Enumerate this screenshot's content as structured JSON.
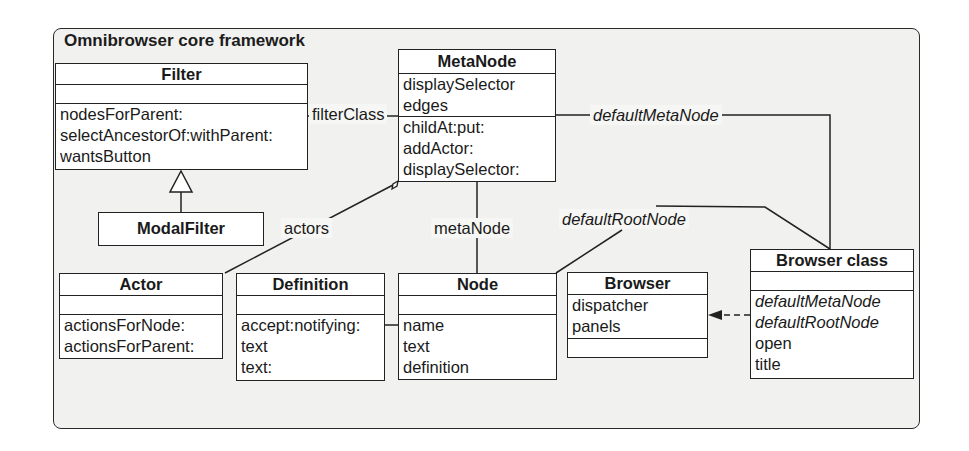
{
  "frame": {
    "title": "Omnibrowser core framework"
  },
  "classes": {
    "filter": {
      "name": "Filter",
      "attributes": [],
      "methods": [
        "nodesForParent:",
        "selectAncestorOf:withParent:",
        "wantsButton"
      ]
    },
    "modal_filter": {
      "name": "ModalFilter"
    },
    "meta_node": {
      "name": "MetaNode",
      "attributes": [
        "displaySelector",
        "edges"
      ],
      "methods": [
        "childAt:put:",
        "addActor:",
        "displaySelector:"
      ]
    },
    "actor": {
      "name": "Actor",
      "attributes": [],
      "methods": [
        "actionsForNode:",
        "actionsForParent:"
      ]
    },
    "definition": {
      "name": "Definition",
      "attributes": [],
      "methods": [
        "accept:notifying:",
        "text",
        "text:"
      ]
    },
    "node": {
      "name": "Node",
      "attributes": [],
      "methods": [
        "name",
        "text",
        "definition"
      ]
    },
    "browser": {
      "name": "Browser",
      "attributes": [
        "dispatcher",
        "panels"
      ],
      "methods": []
    },
    "browser_class": {
      "name": "Browser class",
      "attributes": [],
      "methods_italic": [
        "defaultMetaNode",
        "defaultRootNode"
      ],
      "methods": [
        "open",
        "title"
      ]
    }
  },
  "associations": {
    "filter_class": "filterClass",
    "actors": "actors",
    "meta_node": "metaNode",
    "default_meta_node": "defaultMetaNode",
    "default_root_node": "defaultRootNode"
  }
}
